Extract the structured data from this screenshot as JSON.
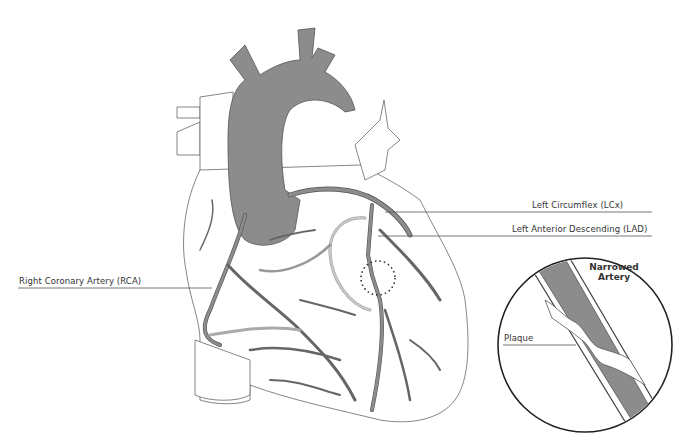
{
  "labels": {
    "lcx": "Left Circumflex (LCx)",
    "lad": "Left Anterior Descending (LAD)",
    "rca": "Right Coronary Artery (RCA)",
    "inset_title_line1": "Narrowed",
    "inset_title_line2": "Artery",
    "plaque": "Plaque"
  },
  "colors": {
    "artery_fill": "#8c8c8c",
    "artery_light": "#b8b8b8",
    "outline": "#555555",
    "background": "#ffffff"
  }
}
